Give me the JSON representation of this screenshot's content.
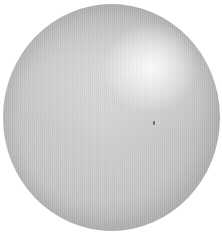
{
  "image": {
    "subject": "shaded gray sphere",
    "background_color": "#ffffff",
    "sphere": {
      "base_color": "#c6c6c6",
      "edge_color": "#b0b0b0",
      "highlight_color": "#fafafa"
    },
    "speck_color": "#6a6a6a"
  }
}
